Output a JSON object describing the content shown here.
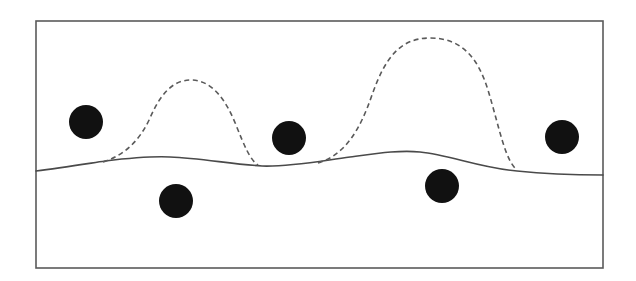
{
  "diagram": {
    "colors": {
      "background": "#ffffff",
      "frame": "#5a5a5a",
      "solid_boundary": "#4a4a4a",
      "dashed_boundary": "#5a5a5a",
      "points": "#111111"
    },
    "frame": {
      "x": 36,
      "y": 21,
      "width": 567,
      "height": 247
    },
    "solid_boundary": {
      "style": "solid",
      "path": "M36,171 C60,168 85,164 105,161 C130,158 150,156 170,157 C200,158 230,164 262,166 C290,167 320,161 350,157 C380,153 400,150 420,152 C450,155 480,168 517,171 C545,174 575,175 603,175"
    },
    "dashed_boundaries": [
      {
        "name": "dashed-bump-left",
        "style": "dashed",
        "path": "M103,162 C125,155 140,140 150,118 C160,95 172,80 191,80 C212,80 226,100 236,125 C244,145 250,160 258,165"
      },
      {
        "name": "dashed-bump-right",
        "style": "dashed",
        "path": "M318,163 C345,155 360,130 372,95 C385,58 400,38 430,38 C462,38 478,58 488,90 C500,130 505,160 517,170"
      }
    ],
    "points": [
      {
        "name": "point-1",
        "cx": 86,
        "cy": 122,
        "r": 17
      },
      {
        "name": "point-2",
        "cx": 176,
        "cy": 201,
        "r": 17
      },
      {
        "name": "point-3",
        "cx": 289,
        "cy": 138,
        "r": 17
      },
      {
        "name": "point-4",
        "cx": 442,
        "cy": 186,
        "r": 17
      },
      {
        "name": "point-5",
        "cx": 562,
        "cy": 137,
        "r": 17
      }
    ]
  }
}
